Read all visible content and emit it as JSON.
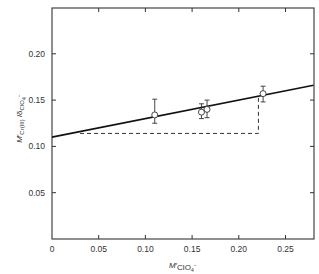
{
  "chart_data": {
    "type": "scatter",
    "title": "",
    "xlabel": "M'ClO4-",
    "ylabel": "M'Cr(III) / δClO4-",
    "xlim": [
      0,
      0.28
    ],
    "ylim": [
      0,
      0.25
    ],
    "x_ticks": [
      "0",
      "0.05",
      "0.10",
      "0.15",
      "0.20",
      "0.25"
    ],
    "y_ticks": [
      "0.05",
      "0.10",
      "0.15",
      "0.20"
    ],
    "grid": false,
    "legend": null,
    "series": [
      {
        "name": "data points",
        "marker": "open-circle",
        "x": [
          0.11,
          0.16,
          0.166,
          0.226
        ],
        "y": [
          0.134,
          0.137,
          0.14,
          0.157
        ],
        "err_low": [
          0.125,
          0.13,
          0.131,
          0.148
        ],
        "err_high": [
          0.151,
          0.146,
          0.15,
          0.165
        ]
      },
      {
        "name": "fit line",
        "style": "solid",
        "x": [
          0,
          0.28
        ],
        "y": [
          0.11,
          0.166
        ]
      },
      {
        "name": "dashed construction",
        "style": "dashed",
        "x": [
          0.03,
          0.221,
          0.221
        ],
        "y": [
          0.114,
          0.114,
          0.154
        ]
      }
    ]
  }
}
